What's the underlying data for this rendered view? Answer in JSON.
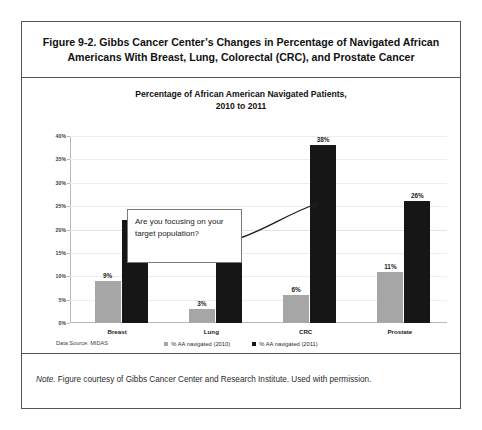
{
  "figure": {
    "caption": "Figure 9-2. Gibbs Cancer Center’s Changes in Percentage of Navigated African Americans With Breast, Lung, Colorectal (CRC), and Prostate Cancer",
    "note_prefix": "Note.",
    "note_body": " Figure courtesy of Gibbs Cancer Center and Research Institute. Used with permission."
  },
  "callout": {
    "text": "Are you focusing on your target population?"
  },
  "source": {
    "text": "Data Source: MIDAS"
  },
  "colors": {
    "series_2010": "#a6a6a6",
    "series_2011": "#161616",
    "frame": "#555555",
    "gridline": "#ededed",
    "axis": "#b9b9b9"
  },
  "chart_data": {
    "type": "bar",
    "title": "Percentage of African American Navigated Patients, 2010 to 2011",
    "title_line1": "Percentage of African American Navigated Patients,",
    "title_line2": "2010 to 2011",
    "xlabel": "",
    "ylabel": "",
    "ylim": [
      0,
      40
    ],
    "ytick_values": [
      0,
      5,
      10,
      15,
      20,
      25,
      30,
      35,
      40
    ],
    "ytick_labels": [
      "0%",
      "5%",
      "10%",
      "15%",
      "20%",
      "25%",
      "30%",
      "35%",
      "40%"
    ],
    "grid": true,
    "legend_position": "bottom",
    "categories": [
      "Breast",
      "Lung",
      "CRC",
      "Prostate"
    ],
    "series": [
      {
        "name": "% AA navigated (2010)",
        "color": "#a6a6a6",
        "values": [
          9,
          3,
          6,
          11
        ],
        "labels": [
          "9%",
          "3%",
          "6%",
          "11%"
        ]
      },
      {
        "name": "% AA navigated  (2011)",
        "color": "#161616",
        "values": [
          22,
          15,
          38,
          26
        ],
        "labels": [
          "22%",
          "15%",
          "38%",
          "26%"
        ]
      }
    ],
    "annotations": [
      {
        "text": "Are you focusing on your target population?",
        "points_to": "CRC 2011 bar"
      }
    ]
  }
}
